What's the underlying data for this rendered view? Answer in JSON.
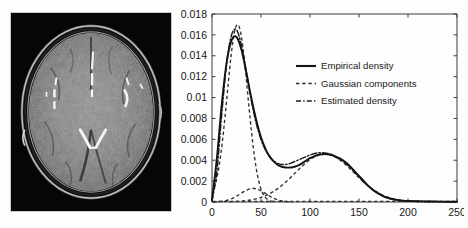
{
  "figure": {
    "panels": [
      "mri-image",
      "density-plot"
    ],
    "background_color": "#fdfdfd"
  },
  "mri": {
    "caption": "",
    "modality": "axial brain MRI slice",
    "background_color": "#050505",
    "description": "Grayscale axial T2/FLAIR-like brain slice with bright hyperintense vessel or catheter structures"
  },
  "chart_data": {
    "type": "line",
    "title": "",
    "xlabel": "",
    "ylabel": "",
    "xlim": [
      0,
      250
    ],
    "ylim": [
      0,
      0.018
    ],
    "xticks": [
      0,
      50,
      100,
      150,
      200,
      250
    ],
    "xtick_labels": [
      "0",
      "50",
      "100",
      "150",
      "200",
      "250"
    ],
    "yticks": [
      0,
      0.002,
      0.004,
      0.006,
      0.008,
      0.01,
      0.012,
      0.014,
      0.016,
      0.018
    ],
    "ytick_labels": [
      "0",
      "0.002",
      "0.004",
      "0.006",
      "0.008",
      "0.01",
      "0.012",
      "0.014",
      "0.016",
      "0.018"
    ],
    "grid": false,
    "legend_position": "upper right",
    "legend": [
      {
        "label": "Empirical density",
        "style": "solid"
      },
      {
        "label": "Gaussian components",
        "style": "dashed"
      },
      {
        "label": "Estimated density",
        "style": "dashdot"
      }
    ],
    "x": [
      0,
      5,
      10,
      15,
      20,
      25,
      30,
      35,
      40,
      45,
      50,
      55,
      60,
      65,
      70,
      75,
      80,
      85,
      90,
      95,
      100,
      105,
      110,
      115,
      120,
      125,
      130,
      135,
      140,
      145,
      150,
      155,
      160,
      165,
      170,
      175,
      180,
      185,
      190,
      195,
      200,
      210,
      220,
      230,
      240,
      250
    ],
    "series": [
      {
        "name": "Empirical density",
        "style": "solid",
        "values": [
          0.0002,
          0.0042,
          0.0094,
          0.0134,
          0.0155,
          0.0158,
          0.0146,
          0.0124,
          0.01,
          0.0079,
          0.0062,
          0.005,
          0.0042,
          0.0037,
          0.0034,
          0.0033,
          0.0033,
          0.0034,
          0.0036,
          0.0039,
          0.0042,
          0.0044,
          0.00455,
          0.0046,
          0.00455,
          0.0044,
          0.0042,
          0.0039,
          0.0035,
          0.003,
          0.0025,
          0.002,
          0.0015,
          0.0011,
          0.0008,
          0.00055,
          0.00038,
          0.00026,
          0.00018,
          0.00013,
          0.0001,
          7e-05,
          5e-05,
          4e-05,
          3e-05,
          2e-05
        ]
      },
      {
        "name": "Estimated density",
        "style": "dashdot",
        "values": [
          0.0001,
          0.003,
          0.0085,
          0.0133,
          0.016,
          0.0165,
          0.015,
          0.0125,
          0.0098,
          0.0076,
          0.006,
          0.0049,
          0.0042,
          0.0038,
          0.0036,
          0.0036,
          0.0037,
          0.0039,
          0.0041,
          0.0043,
          0.0045,
          0.00465,
          0.00472,
          0.0047,
          0.0046,
          0.0044,
          0.0041,
          0.0038,
          0.0034,
          0.0029,
          0.0024,
          0.0019,
          0.0015,
          0.0011,
          0.0008,
          0.00056,
          0.00039,
          0.00027,
          0.00019,
          0.00013,
          0.0001,
          7e-05,
          5e-05,
          4e-05,
          3e-05,
          2e-05
        ]
      }
    ],
    "gaussian_components": [
      {
        "name": "component-1",
        "mean": 26,
        "sigma": 10.5,
        "peak": 0.017
      },
      {
        "name": "component-2",
        "mean": 42,
        "sigma": 13,
        "peak": 0.0013
      },
      {
        "name": "component-3",
        "mean": 115,
        "sigma": 30,
        "peak": 0.0046
      }
    ]
  }
}
